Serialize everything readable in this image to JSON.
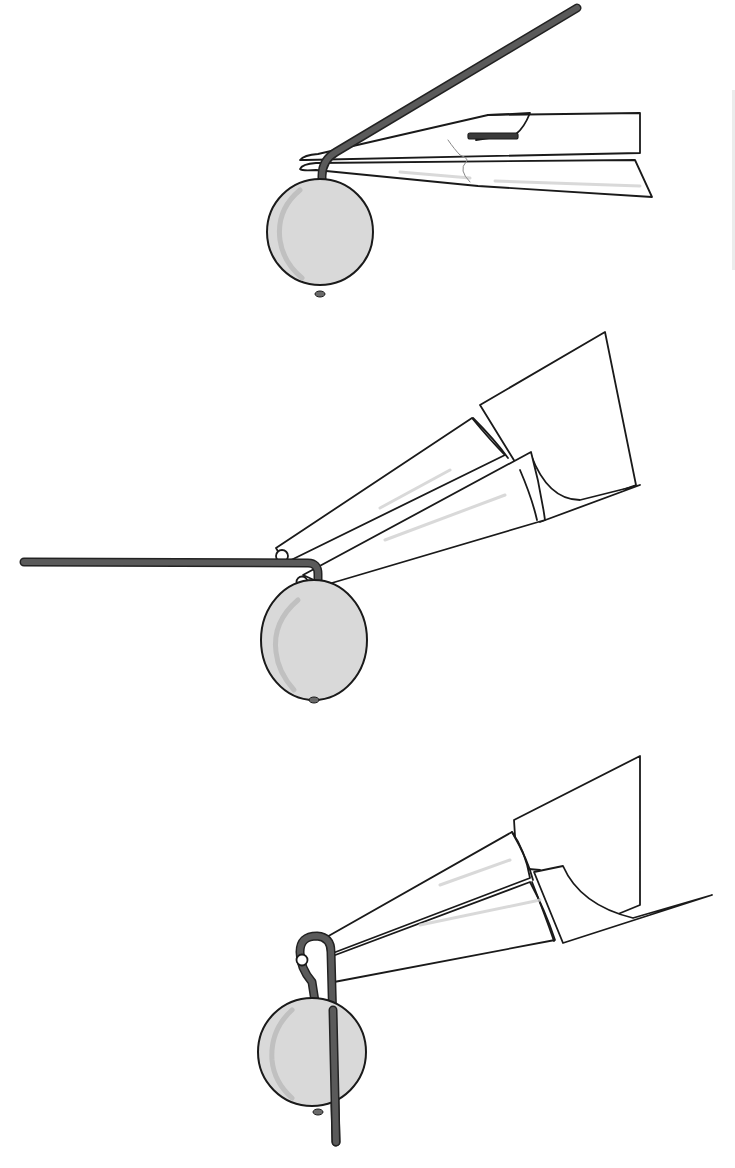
{
  "title": "",
  "colors": {
    "background": "#ffffff",
    "outline": "#1a1a1a",
    "wire_outline": "#222222",
    "wire_fill": "#5a5a5a",
    "bead_fill": "#d9d9d9",
    "bead_shade": "#b5b5b5"
  },
  "steps": [
    {
      "id": "step-1",
      "description": "Wire through bead bent upward at 45 degrees with chain-nose pliers gripping above the bead",
      "bead": {
        "cx": 320,
        "cy": 232,
        "r": 53,
        "bottom_nub": [
          320,
          296
        ]
      },
      "wire_path": "M322 197 L322 176 Q322 160 336 152 L577 8",
      "tool": "chain-nose-pliers"
    },
    {
      "id": "step-2",
      "description": "Round-nose pliers grip the wire just above the bend; wire extends horizontally to the left",
      "bead": {
        "cx": 314,
        "cy": 638,
        "rx": 53,
        "ry": 60,
        "bottom_nub": [
          314,
          700
        ]
      },
      "wire_path": "M318 590 L318 572 Q318 560 308 560 L24 562",
      "tool": "round-nose-pliers"
    },
    {
      "id": "step-3",
      "description": "Wire wrapped around the pliers jaw forming a loop, tail hanging down past the bead",
      "bead": {
        "cx": 312,
        "cy": 1052,
        "r": 53,
        "bottom_nub": [
          318,
          1112
        ]
      },
      "wire_path": "M316 1008 L312 978 Q302 960 302 950 Q302 935 318 935 Q330 936 330 950 L336 1142",
      "tool": "round-nose-pliers"
    }
  ]
}
